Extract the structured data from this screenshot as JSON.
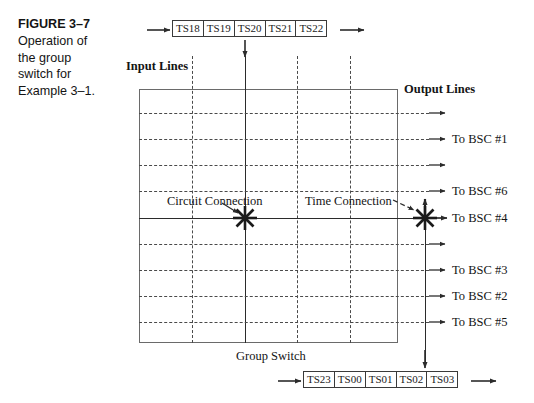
{
  "figure": {
    "number_label": "FIGURE 3–7",
    "caption_lines": [
      "Operation of",
      "the group",
      "switch for",
      "Example 3–1."
    ]
  },
  "diagram": {
    "input_lines_label": "Input Lines",
    "output_lines_label": "Output Lines",
    "group_switch_label": "Group Switch",
    "circuit_connection_label": "Circuit Connection",
    "time_connection_label": "Time Connection",
    "top_timeslots": [
      "TS18",
      "TS19",
      "TS20",
      "TS21",
      "TS22"
    ],
    "bottom_timeslots": [
      "TS23",
      "TS00",
      "TS01",
      "TS02",
      "TS03"
    ],
    "top_selected_timeslot": "TS20",
    "bottom_selected_timeslot": "TS02",
    "output_rows": [
      {
        "index": 1,
        "label": ""
      },
      {
        "index": 2,
        "label": "To BSC #1"
      },
      {
        "index": 3,
        "label": ""
      },
      {
        "index": 4,
        "label": "To BSC #6"
      },
      {
        "index": 5,
        "label": "To BSC #4"
      },
      {
        "index": 6,
        "label": ""
      },
      {
        "index": 7,
        "label": "To BSC #3"
      },
      {
        "index": 8,
        "label": "To BSC #2"
      },
      {
        "index": 9,
        "label": "To BSC #5"
      }
    ],
    "colors": {
      "line": "#2b2b2b",
      "dashed_line": "#4a4a4a",
      "frame": "#6a6a6a",
      "text": "#141414",
      "background": "#ffffff"
    }
  }
}
